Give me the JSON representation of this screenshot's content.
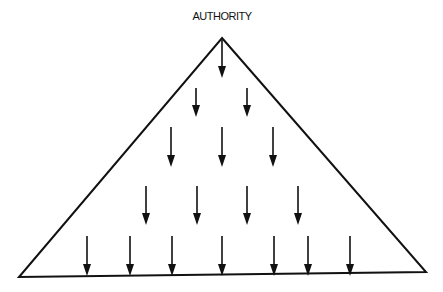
{
  "diagram": {
    "title": "AUTHORITY",
    "shape": "triangle",
    "stroke_color": "#111111",
    "background": "#ffffff",
    "apex": [
      222,
      38
    ],
    "base_left": [
      19,
      277
    ],
    "base_right": [
      426,
      272
    ],
    "arrow_direction": "down",
    "arrow_rows": [
      {
        "row": 1,
        "count": 1,
        "x": [
          222
        ],
        "y_start": 40,
        "y_end": 78
      },
      {
        "row": 2,
        "count": 2,
        "x": [
          196,
          247
        ],
        "y_start": 88,
        "y_end": 117
      },
      {
        "row": 3,
        "count": 3,
        "x": [
          171,
          222,
          273
        ],
        "y_start": 127,
        "y_end": 167
      },
      {
        "row": 4,
        "count": 4,
        "x": [
          146,
          197,
          247,
          298
        ],
        "y_start": 186,
        "y_end": 225
      },
      {
        "row": 5,
        "count": 7,
        "x": [
          87,
          130,
          172,
          222,
          274,
          308,
          350
        ],
        "y_start": 236,
        "y_end": 276
      }
    ]
  }
}
